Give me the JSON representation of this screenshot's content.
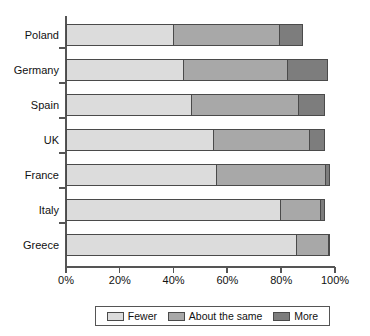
{
  "chart_data": {
    "type": "bar",
    "subtype": "horizontal-stacked-100",
    "title": "",
    "xlabel": "",
    "ylabel": "",
    "categories": [
      "Poland",
      "Germany",
      "Spain",
      "UK",
      "France",
      "Italy",
      "Greece"
    ],
    "series": [
      {
        "name": "Fewer",
        "color": "#dcdcdc",
        "values": [
          40,
          44,
          47,
          55,
          56,
          80,
          86
        ]
      },
      {
        "name": "About the same",
        "color": "#a8a8a8",
        "values": [
          40,
          39,
          40,
          36,
          41,
          15,
          12
        ]
      },
      {
        "name": "More",
        "color": "#7d7d7d",
        "values": [
          9,
          15,
          10,
          6,
          2,
          2,
          1
        ]
      }
    ],
    "xlim": [
      0,
      100
    ],
    "xticks": [
      0,
      20,
      40,
      60,
      80,
      100
    ],
    "xtick_labels": [
      "0%",
      "20%",
      "40%",
      "60%",
      "80%",
      "100%"
    ],
    "grid": false,
    "legend_position": "bottom"
  },
  "legend": {
    "entries": [
      {
        "label": "Fewer",
        "swatch": "legend-swatch-fewer"
      },
      {
        "label": "About the same",
        "swatch": "legend-swatch-about-the-same"
      },
      {
        "label": "More",
        "swatch": "legend-swatch-more"
      }
    ]
  }
}
